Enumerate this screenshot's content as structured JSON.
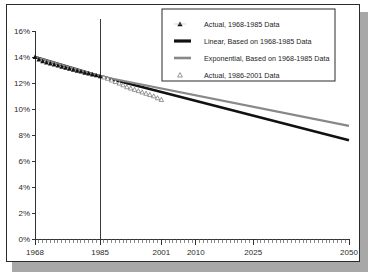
{
  "chart_data": {
    "type": "line",
    "title": "",
    "subtitle": "",
    "xlabel": "",
    "ylabel": "",
    "xlim": [
      1968,
      2050
    ],
    "ylim": [
      0,
      16
    ],
    "grid": false,
    "legend_position": "top-right",
    "y_tick_labels": [
      "16%",
      "14%",
      "12%",
      "10%",
      "8%",
      "6%",
      "4%",
      "2%",
      "0%"
    ],
    "y_tick_values": [
      16,
      14,
      12,
      10,
      8,
      6,
      4,
      2,
      0
    ],
    "x_tick_labels": [
      "1968",
      "1985",
      "2001",
      "2010",
      "2025",
      "2050"
    ],
    "x_tick_values": [
      1968,
      1985,
      2001,
      2010,
      2025,
      2050
    ],
    "annotations": [
      {
        "name": "divider-1985",
        "type": "vline",
        "x": 1985
      }
    ],
    "legend": [
      {
        "label": "Actual, 1968-1985 Data",
        "marker": "filled-triangle",
        "color": "#111111"
      },
      {
        "label": "Linear, Based on 1968-1985 Data",
        "marker": "thick-line",
        "color": "#111111"
      },
      {
        "label": "Exponential, Based on 1968-1985 Data",
        "marker": "thick-line",
        "color": "#888888"
      },
      {
        "label": "Actual, 1986-2001 Data",
        "marker": "hollow-triangle",
        "color": "#ffffff"
      }
    ],
    "series": [
      {
        "name": "Actual, 1968-1985 Data",
        "type": "scatter",
        "marker": "filled-triangle",
        "color": "#111111",
        "x": [
          1968,
          1969,
          1970,
          1971,
          1972,
          1973,
          1974,
          1975,
          1976,
          1977,
          1978,
          1979,
          1980,
          1981,
          1982,
          1983,
          1984,
          1985
        ],
        "values": [
          14.0,
          13.82,
          13.68,
          13.58,
          13.5,
          13.42,
          13.34,
          13.26,
          13.18,
          13.1,
          13.02,
          12.95,
          12.88,
          12.8,
          12.73,
          12.66,
          12.59,
          12.52
        ]
      },
      {
        "name": "Actual, 1986-2001 Data",
        "type": "scatter",
        "marker": "hollow-triangle",
        "color": "#ffffff",
        "x": [
          1986,
          1987,
          1988,
          1989,
          1990,
          1991,
          1992,
          1993,
          1994,
          1995,
          1996,
          1997,
          1998,
          1999,
          2000,
          2001
        ],
        "values": [
          12.45,
          12.35,
          12.22,
          12.1,
          11.98,
          11.85,
          11.7,
          11.6,
          11.5,
          11.4,
          11.3,
          11.2,
          11.1,
          11.0,
          10.85,
          10.72
        ]
      },
      {
        "name": "Linear, Based on 1968-1985 Data",
        "type": "line",
        "color": "#111111",
        "x": [
          1968,
          1985,
          2050
        ],
        "values": [
          14.0,
          12.52,
          7.6
        ]
      },
      {
        "name": "Exponential, Based on 1968-1985 Data",
        "type": "line",
        "color": "#888888",
        "x": [
          1968,
          1985,
          2050
        ],
        "values": [
          14.0,
          12.52,
          8.7
        ]
      }
    ]
  },
  "figure": {
    "background_color": "#ffffff",
    "frame_color": "#2b2b2b",
    "shadow_color": "#a8a8a8"
  }
}
